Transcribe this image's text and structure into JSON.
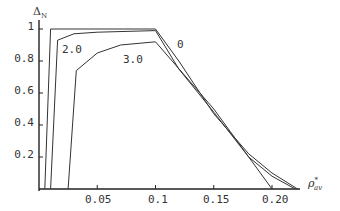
{
  "chart_data": {
    "type": "line",
    "title": "",
    "xlabel": "ρ*_av",
    "ylabel": "Δ_N",
    "xlim": [
      0,
      0.225
    ],
    "ylim": [
      0,
      1.03
    ],
    "x_ticks": [
      "0.05",
      "0.1",
      "0.15",
      "0.20"
    ],
    "y_ticks": [
      "0.2",
      "0.4",
      "0.6",
      "0.8",
      "1"
    ],
    "grid": false,
    "legend": "inline curve labels",
    "series": [
      {
        "name": "0",
        "points": [
          [
            0.005,
            0
          ],
          [
            0.01,
            1.0
          ],
          [
            0.1,
            1.0
          ],
          [
            0.12,
            0.8
          ],
          [
            0.15,
            0.47
          ],
          [
            0.18,
            0.22
          ],
          [
            0.2,
            0.1
          ],
          [
            0.222,
            0
          ]
        ]
      },
      {
        "name": "2.0",
        "points": [
          [
            0.01,
            0
          ],
          [
            0.016,
            0.93
          ],
          [
            0.03,
            0.97
          ],
          [
            0.05,
            0.98
          ],
          [
            0.1,
            0.99
          ],
          [
            0.12,
            0.75
          ],
          [
            0.15,
            0.48
          ],
          [
            0.18,
            0.2
          ],
          [
            0.2,
            0.08
          ],
          [
            0.22,
            0
          ]
        ]
      },
      {
        "name": "3.0",
        "points": [
          [
            0.025,
            0
          ],
          [
            0.032,
            0.74
          ],
          [
            0.05,
            0.85
          ],
          [
            0.07,
            0.9
          ],
          [
            0.1,
            0.92
          ],
          [
            0.15,
            0.5
          ],
          [
            0.18,
            0.2
          ],
          [
            0.19,
            0.1
          ],
          [
            0.2,
            0
          ]
        ]
      }
    ]
  },
  "labels": {
    "y_axis": "Δ",
    "y_axis_sub": "N",
    "x_axis": "ρ",
    "x_axis_sup": "*",
    "x_axis_sub": "av",
    "curve_0": "0",
    "curve_2": "2.0",
    "curve_3": "3.0"
  }
}
